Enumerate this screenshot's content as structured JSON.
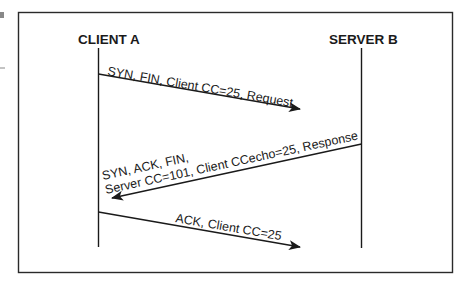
{
  "diagram": {
    "type": "sequence",
    "participants": [
      {
        "id": "client",
        "label": "CLIENT A"
      },
      {
        "id": "server",
        "label": "SERVER B"
      }
    ],
    "messages": [
      {
        "from": "client",
        "to": "server",
        "lines": [
          "SYN, FIN, Client CC=25, Request"
        ]
      },
      {
        "from": "server",
        "to": "client",
        "lines": [
          "SYN, ACK, FIN,",
          "Server CC=101, Client CCecho=25, Response"
        ]
      },
      {
        "from": "client",
        "to": "server",
        "lines": [
          "ACK, Client CC=25"
        ]
      }
    ],
    "colors": {
      "ink": "#1a1a1a",
      "background": "#ffffff"
    }
  }
}
